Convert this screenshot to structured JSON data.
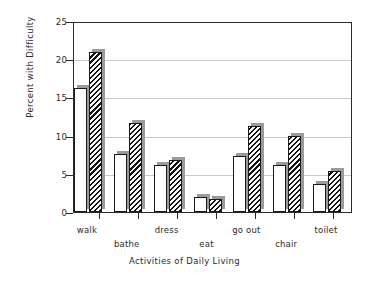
{
  "chart_data": {
    "type": "bar",
    "title": "",
    "xlabel": "Activities of Daily Living",
    "ylabel": "Percent with Difficulty",
    "categories": [
      "walk",
      "bathe",
      "dress",
      "eat",
      "go out",
      "chair",
      "toilet"
    ],
    "series": [
      {
        "name": "open",
        "values": [
          16.2,
          7.6,
          6.2,
          1.9,
          7.3,
          6.2,
          3.7
        ]
      },
      {
        "name": "hatched",
        "values": [
          21.0,
          11.6,
          6.8,
          1.7,
          11.3,
          10.0,
          5.4
        ]
      }
    ],
    "ylim": [
      0,
      25
    ],
    "yticks": [
      0,
      5,
      10,
      15,
      20,
      25
    ],
    "ytick_labels": [
      "0",
      "5",
      "10",
      "15",
      "20",
      "25"
    ],
    "grid": true,
    "legend": "none",
    "label_stagger": [
      "upper",
      "lower",
      "upper",
      "lower",
      "upper",
      "lower",
      "upper"
    ]
  },
  "axes": {
    "y_tick_labels": [
      "25",
      "20",
      "15",
      "10",
      "5",
      "0"
    ],
    "x_tick_labels": [
      "walk",
      "bathe",
      "dress",
      "eat",
      "go out",
      "chair",
      "toilet"
    ]
  },
  "style": {
    "frame_color": "#2b2b2b",
    "grid_color": "#c9c9c9",
    "bar_edge_color": "#1a1a1a",
    "bar_open_fill": "#ffffff",
    "bar_hatch_color": "#111111",
    "shadow_color": "#9b9b9b",
    "background": "#ffffff"
  }
}
